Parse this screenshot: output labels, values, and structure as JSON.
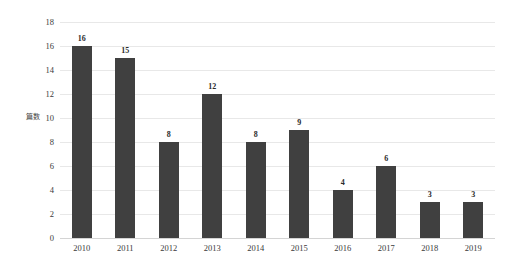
{
  "chart_data": {
    "type": "bar",
    "title": "",
    "subtitle": "",
    "xlabel": "",
    "ylabel": "篇数",
    "categories": [
      "2010",
      "2011",
      "2012",
      "2013",
      "2014",
      "2015",
      "2016",
      "2017",
      "2018",
      "2019"
    ],
    "values": [
      16,
      15,
      8,
      12,
      8,
      9,
      4,
      6,
      3,
      3
    ],
    "value_labels": [
      "16",
      "15",
      "8",
      "12",
      "8",
      "9",
      "4",
      "6",
      "3",
      "3"
    ],
    "ylim": [
      0,
      18
    ],
    "ytick_values": [
      0,
      2,
      4,
      6,
      8,
      10,
      12,
      14,
      16,
      18
    ],
    "ytick_labels": [
      "0",
      "2",
      "4",
      "6",
      "8",
      "10",
      "12",
      "14",
      "16",
      "18"
    ],
    "grid": true,
    "grid_axis": "y",
    "legend": false,
    "legend_position": "none",
    "bar_color": "#404040",
    "gridline_color": "#e8e8e8",
    "background_color": "#ffffff",
    "text_color": "#3a3a3a"
  }
}
